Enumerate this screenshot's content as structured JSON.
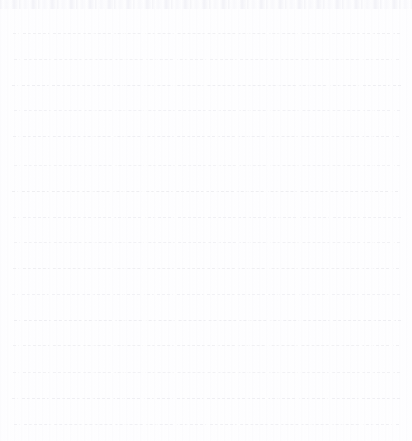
{
  "document": {
    "kind": "scanned-ruled-notebook-page",
    "description": "Blank scanned sheet of lined notebook paper",
    "page_width": 412,
    "page_height": 441,
    "background_color": "#fefeff",
    "text_content": "",
    "has_handwriting": false,
    "has_printed_text": false
  },
  "ruling": {
    "line_count": 16,
    "line_color": "#f1f1f4",
    "line_style": "dashed",
    "line_thickness_px": 1,
    "dash_length_px": 4,
    "dash_gap_px": 2,
    "left_margin_px": 13,
    "right_edge_px": 400,
    "first_line_y_px": 33,
    "line_spacing_px": 26,
    "lines": [
      {
        "index": 1,
        "y": 33,
        "x_start": 13,
        "x_end": 400,
        "color": "#f0f0f3",
        "dash": "4px 2px"
      },
      {
        "index": 2,
        "y": 59,
        "x_start": 14,
        "x_end": 399,
        "color": "#f1f1f4",
        "dash": "5px 2px"
      },
      {
        "index": 3,
        "y": 85,
        "x_start": 12,
        "x_end": 401,
        "color": "#eeeef2",
        "dash": "4px 3px"
      },
      {
        "index": 4,
        "y": 110,
        "x_start": 14,
        "x_end": 400,
        "color": "#f1f1f5",
        "dash": "6px 2px"
      },
      {
        "index": 5,
        "y": 136,
        "x_start": 13,
        "x_end": 399,
        "color": "#efeff3",
        "dash": "4px 2px"
      },
      {
        "index": 6,
        "y": 165,
        "x_start": 14,
        "x_end": 400,
        "color": "#f2f2f5",
        "dash": "5px 3px"
      },
      {
        "index": 7,
        "y": 191,
        "x_start": 12,
        "x_end": 398,
        "color": "#eeeef1",
        "dash": "4px 2px"
      },
      {
        "index": 8,
        "y": 217,
        "x_start": 13,
        "x_end": 401,
        "color": "#f0f0f4",
        "dash": "6px 2px"
      },
      {
        "index": 9,
        "y": 242,
        "x_start": 14,
        "x_end": 400,
        "color": "#f1f1f4",
        "dash": "4px 3px"
      },
      {
        "index": 10,
        "y": 268,
        "x_start": 13,
        "x_end": 399,
        "color": "#efeff2",
        "dash": "5px 2px"
      },
      {
        "index": 11,
        "y": 294,
        "x_start": 12,
        "x_end": 400,
        "color": "#f1f1f5",
        "dash": "4px 2px"
      },
      {
        "index": 12,
        "y": 320,
        "x_start": 14,
        "x_end": 401,
        "color": "#eeeef2",
        "dash": "6px 3px"
      },
      {
        "index": 13,
        "y": 345,
        "x_start": 13,
        "x_end": 399,
        "color": "#f0f0f3",
        "dash": "4px 2px"
      },
      {
        "index": 14,
        "y": 372,
        "x_start": 13,
        "x_end": 400,
        "color": "#f1f1f4",
        "dash": "5px 2px"
      },
      {
        "index": 15,
        "y": 398,
        "x_start": 12,
        "x_end": 400,
        "color": "#efeff3",
        "dash": "4px 3px"
      },
      {
        "index": 16,
        "y": 424,
        "x_start": 14,
        "x_end": 399,
        "color": "#f0f0f4",
        "dash": "5px 2px"
      }
    ]
  },
  "artifacts": {
    "top_scan_noise": {
      "present": true,
      "y": 0,
      "height": 9,
      "color": "#f4f4f8"
    }
  }
}
